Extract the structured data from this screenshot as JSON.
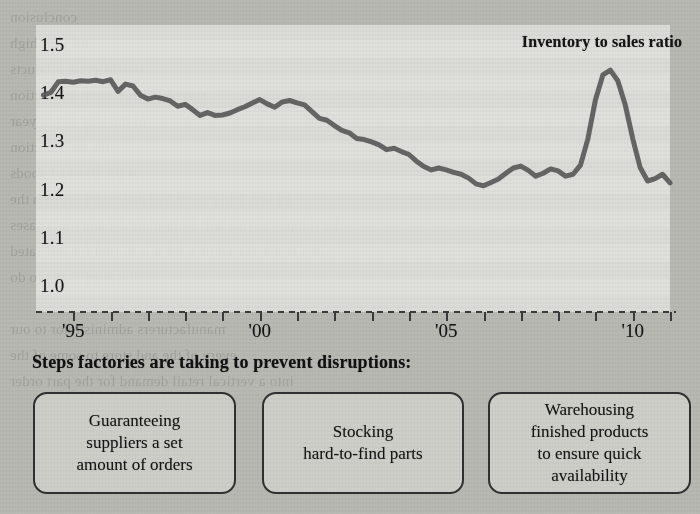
{
  "chart_data": {
    "type": "line",
    "title": "Inventory to sales ratio",
    "xlabel": "",
    "ylabel": "",
    "ylim": [
      1.0,
      1.5
    ],
    "xlim": [
      1994.0,
      2011.0
    ],
    "grid": false,
    "legend": "none",
    "yticks": [
      "1.5",
      "1.4",
      "1.3",
      "1.2",
      "1.1",
      "1.0"
    ],
    "ytick_values": [
      1.5,
      1.4,
      1.3,
      1.2,
      1.1,
      1.0
    ],
    "xticks": [
      "'95",
      "'00",
      "'05",
      "'10"
    ],
    "xtick_values": [
      1995,
      2000,
      2005,
      2010
    ],
    "minor_xtick_values": [
      1995,
      1996,
      1997,
      1998,
      1999,
      2000,
      2001,
      2002,
      2003,
      2004,
      2005,
      2006,
      2007,
      2008,
      2009,
      2010,
      2011
    ],
    "series": [
      {
        "name": "Inventory to sales ratio",
        "color": "#5a5a5a",
        "x": [
          1994.2,
          1994.4,
          1994.6,
          1994.8,
          1995.0,
          1995.2,
          1995.4,
          1995.6,
          1995.8,
          1996.0,
          1996.2,
          1996.4,
          1996.6,
          1996.8,
          1997.0,
          1997.2,
          1997.4,
          1997.6,
          1997.8,
          1998.0,
          1998.2,
          1998.4,
          1998.6,
          1998.8,
          1999.0,
          1999.2,
          1999.4,
          1999.6,
          1999.8,
          2000.0,
          2000.2,
          2000.4,
          2000.6,
          2000.8,
          2001.0,
          2001.2,
          2001.4,
          2001.6,
          2001.8,
          2002.0,
          2002.2,
          2002.4,
          2002.6,
          2002.8,
          2003.0,
          2003.2,
          2003.4,
          2003.6,
          2003.8,
          2004.0,
          2004.2,
          2004.4,
          2004.6,
          2004.8,
          2005.0,
          2005.2,
          2005.4,
          2005.6,
          2005.8,
          2006.0,
          2006.2,
          2006.4,
          2006.6,
          2006.8,
          2007.0,
          2007.2,
          2007.4,
          2007.6,
          2007.8,
          2008.0,
          2008.2,
          2008.4,
          2008.6,
          2008.8,
          2009.0,
          2009.2,
          2009.4,
          2009.6,
          2009.8,
          2010.0,
          2010.2,
          2010.4,
          2010.6,
          2010.8,
          2011.0
        ],
        "y": [
          1.4,
          1.406,
          1.428,
          1.429,
          1.427,
          1.43,
          1.429,
          1.431,
          1.428,
          1.432,
          1.408,
          1.423,
          1.419,
          1.4,
          1.392,
          1.396,
          1.393,
          1.388,
          1.377,
          1.381,
          1.37,
          1.358,
          1.364,
          1.358,
          1.359,
          1.363,
          1.37,
          1.376,
          1.384,
          1.391,
          1.382,
          1.375,
          1.386,
          1.389,
          1.384,
          1.38,
          1.366,
          1.352,
          1.348,
          1.337,
          1.327,
          1.322,
          1.31,
          1.308,
          1.303,
          1.297,
          1.287,
          1.29,
          1.283,
          1.277,
          1.263,
          1.252,
          1.245,
          1.249,
          1.245,
          1.24,
          1.236,
          1.228,
          1.216,
          1.212,
          1.219,
          1.226,
          1.238,
          1.249,
          1.253,
          1.244,
          1.232,
          1.238,
          1.247,
          1.243,
          1.232,
          1.236,
          1.255,
          1.31,
          1.39,
          1.442,
          1.452,
          1.43,
          1.38,
          1.31,
          1.25,
          1.222,
          1.227,
          1.236,
          1.218
        ]
      }
    ]
  },
  "chart": {
    "title": "Inventory to sales ratio"
  },
  "subtitle": "Steps factories are taking to prevent disruptions:",
  "steps": [
    {
      "label": "Guaranteeing\nsuppliers a set\namount of orders"
    },
    {
      "label": "Stocking\nhard-to-find parts"
    },
    {
      "label": "Warehousing\nfinished products\nto ensure quick\navailability"
    }
  ],
  "background": {
    "paper_color": "#b9b9b4",
    "panel_color": "#e4e4e0",
    "ink_color": "#1a1a1a",
    "line_color": "#5a5a5a",
    "bleed_text": "conclusion\nand very high\nthe different products\nthe same stops from production\nof the way of old year\nthe construction\nof the finished goods\nthe sort into a complied and move through the\nDevelopment line will be produced mainly less cases\nin a sort assessed by a what is to find for separated\nthe most direct to do\n\nmanufacturers administrator to our\nevery of the and store to some of the\ninto a vertical retail demand for the part order"
  }
}
